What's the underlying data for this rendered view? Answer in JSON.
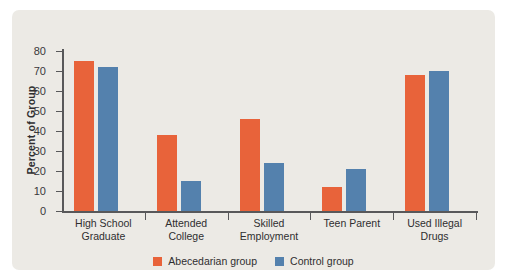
{
  "chart_data": {
    "type": "bar",
    "title": "",
    "subtitle": "",
    "xlabel": "",
    "ylabel": "Percent of Group",
    "ylim": [
      0,
      80
    ],
    "ytick_step": 10,
    "yticks": [
      "80",
      "70",
      "60",
      "50",
      "40",
      "30",
      "20",
      "10",
      "0"
    ],
    "grid": false,
    "legend_position": "bottom-center",
    "categories": [
      "High School Graduate",
      "Attended College",
      "Skilled Employment",
      "Teen Parent",
      "Used Illegal Drugs"
    ],
    "category_lines": [
      [
        "High School",
        "Graduate"
      ],
      [
        "Attended",
        "College"
      ],
      [
        "Skilled",
        "Employment"
      ],
      [
        "Teen Parent",
        ""
      ],
      [
        "Used Illegal",
        "Drugs"
      ]
    ],
    "series": [
      {
        "name": "Abecedarian group",
        "color": "#e8633a",
        "values": [
          75,
          38,
          46,
          12,
          68
        ]
      },
      {
        "name": "Control group",
        "color": "#5481ad",
        "values": [
          72,
          15,
          24,
          21,
          70
        ]
      }
    ]
  },
  "colors": {
    "panel_background": "#eceae5",
    "page_background": "#ffffff",
    "axis": "#58585a",
    "text": "#2f2e30",
    "abecedarian": "#e8633a",
    "control": "#5481ad"
  }
}
